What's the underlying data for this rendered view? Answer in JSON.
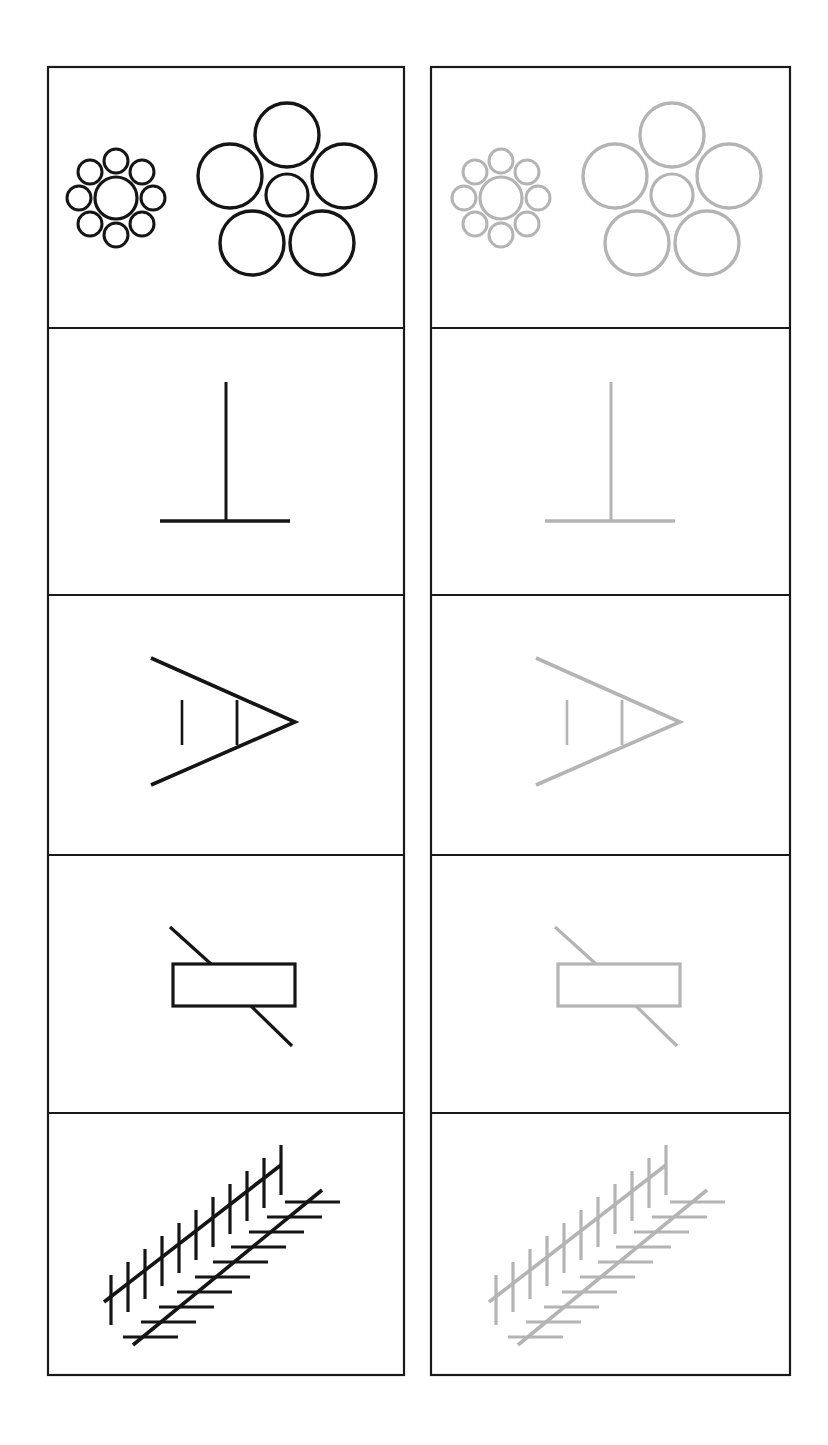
{
  "page": {
    "background_color": "#ffffff",
    "width": 828,
    "height": 1445
  },
  "style": {
    "frame_color": "#1a1a1a",
    "frame_stroke_width": 2.2,
    "dark_ink_color": "#151515",
    "faded_ink_color": "#b4b4b4"
  },
  "grid": {
    "columns": [
      {
        "name": "left-column",
        "variant": "high-contrast",
        "x": 48,
        "width": 356
      },
      {
        "name": "right-column",
        "variant": "low-contrast",
        "x": 431,
        "width": 359
      }
    ],
    "column_count": 2,
    "row_count": 5,
    "top": 67,
    "bottom": 1375,
    "row_dividers_y": [
      328,
      595,
      855,
      1113
    ]
  },
  "chart_data": {
    "type": "table",
    "columns": [
      "High contrast (black ink)",
      "Low contrast (grey ink)"
    ],
    "rows": [
      {
        "index": 1,
        "illusion_name": "Ebbinghaus illusion",
        "description": "Two identical central circles, one ringed by eight small circles, the other ringed by five large circles",
        "elements": {
          "left_group": {
            "center_circle": {
              "cx": 116,
              "cy": 198,
              "r": 21
            },
            "surround_count": 8,
            "surround_radius": 12,
            "surround_distance": 37
          },
          "right_group": {
            "center_circle": {
              "cx": 287,
              "cy": 195,
              "r": 21
            },
            "surround_count": 5,
            "surround_radius": 32,
            "surround_distance": 60
          }
        }
      },
      {
        "index": 2,
        "illusion_name": "Vertical-horizontal illusion",
        "description": "Inverted T: a vertical line meeting the midpoint of an equal-length horizontal line",
        "elements": {
          "vertical": {
            "x": 226,
            "y1": 382,
            "y2": 521
          },
          "horizontal": {
            "y": 521,
            "x1": 160,
            "x2": 290
          }
        }
      },
      {
        "index": 3,
        "illusion_name": "Chevron (Müller-Lyer type) illusion",
        "description": "An arrowhead chevron with two vertical comparison lines of equal length",
        "elements": {
          "chevron_apex": {
            "x": 295,
            "y": 722
          },
          "chevron_upper_end": {
            "x": 151,
            "y": 658
          },
          "chevron_lower_end": {
            "x": 151,
            "y": 785
          },
          "comparison_line_left": {
            "x": 182,
            "y1": 700,
            "y2": 745
          },
          "comparison_line_right": {
            "x": 237,
            "y1": 700,
            "y2": 745
          }
        }
      },
      {
        "index": 4,
        "illusion_name": "Poggendorff illusion",
        "description": "A single oblique line interrupted by a rectangle; the collinear segments appear offset",
        "elements": {
          "rectangle": {
            "x": 173,
            "y": 964,
            "width": 122,
            "height": 42
          },
          "upper_segment": {
            "x1": 170,
            "y1": 927,
            "x2": 211,
            "y2": 964
          },
          "lower_segment": {
            "x1": 251,
            "y1": 1006,
            "x2": 292,
            "y2": 1046
          }
        }
      },
      {
        "index": 5,
        "illusion_name": "Zöllner illusion",
        "description": "Two parallel oblique lines crossed by opposing sets of short hatch marks",
        "elements": {
          "line_upper": {
            "x1": 104,
            "y1": 1302,
            "x2": 281,
            "y2": 1165,
            "hatch_orientation": "vertical",
            "hatch_count": 11
          },
          "line_lower": {
            "x1": 133,
            "y1": 1345,
            "x2": 322,
            "y2": 1190,
            "hatch_orientation": "horizontal",
            "hatch_count": 11
          }
        }
      }
    ]
  }
}
